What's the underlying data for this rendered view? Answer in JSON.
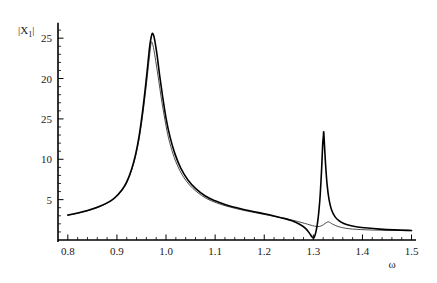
{
  "chart_data": {
    "type": "line",
    "title": "",
    "subtitle": "",
    "xlabel": "ω",
    "ylabel": "|X₁|",
    "ylabel_base": "|X",
    "ylabel_sub": "1",
    "ylabel_close": "|",
    "xlim": [
      0.78,
      1.505
    ],
    "ylim": [
      0.0,
      27.5
    ],
    "grid": false,
    "legend": null,
    "legend_position": "none",
    "x_ticks": [
      0.8,
      0.9,
      1.0,
      1.1,
      1.2,
      1.3,
      1.4,
      1.5
    ],
    "x_tick_labels": [
      "0.8",
      "0.9",
      "1.0",
      "1.1",
      "1.2",
      "1.3",
      "1.4",
      "1.5"
    ],
    "x_minor_step": 0.02,
    "y_ticks": [
      5,
      10,
      15,
      20,
      25
    ],
    "y_tick_labels": [
      "5",
      "10",
      "25",
      "20",
      "25"
    ],
    "y_tick_label_note": "third label printed as 25 in source (typo for 15)",
    "y_minor_step": 1,
    "annotations": [],
    "series": [
      {
        "name": "primary",
        "style": "solid-thick",
        "color": "#000000",
        "peaks": [
          {
            "x": 0.972,
            "y": 25.6,
            "label": "resonance-1"
          },
          {
            "x": 1.321,
            "y": 13.4,
            "label": "resonance-2"
          }
        ],
        "antiresonance": [
          {
            "x": 1.301,
            "y": 0.25
          }
        ],
        "x": [
          0.8,
          0.82,
          0.84,
          0.86,
          0.88,
          0.895,
          0.91,
          0.92,
          0.93,
          0.938,
          0.945,
          0.952,
          0.958,
          0.963,
          0.967,
          0.97,
          0.972,
          0.975,
          0.978,
          0.982,
          0.987,
          0.993,
          1.0,
          1.008,
          1.018,
          1.03,
          1.045,
          1.06,
          1.08,
          1.1,
          1.12,
          1.14,
          1.16,
          1.18,
          1.2,
          1.22,
          1.24,
          1.258,
          1.272,
          1.284,
          1.292,
          1.297,
          1.3,
          1.302,
          1.305,
          1.308,
          1.311,
          1.314,
          1.317,
          1.319,
          1.3205,
          1.321,
          1.3215,
          1.323,
          1.325,
          1.328,
          1.332,
          1.337,
          1.344,
          1.352,
          1.362,
          1.375,
          1.39,
          1.41,
          1.435,
          1.465,
          1.5
        ],
        "y": [
          3.1,
          3.35,
          3.65,
          4.05,
          4.6,
          5.2,
          6.2,
          7.2,
          8.8,
          10.6,
          12.8,
          15.8,
          18.9,
          21.8,
          24.1,
          25.2,
          25.6,
          25.3,
          24.4,
          22.8,
          20.4,
          17.8,
          15.1,
          12.8,
          10.7,
          8.9,
          7.4,
          6.4,
          5.45,
          4.85,
          4.4,
          4.05,
          3.75,
          3.5,
          3.25,
          2.98,
          2.68,
          2.35,
          1.95,
          1.45,
          0.85,
          0.4,
          0.25,
          0.35,
          0.95,
          1.9,
          3.4,
          5.6,
          9.0,
          11.8,
          12.9,
          13.4,
          13.1,
          11.4,
          9.3,
          6.9,
          5.0,
          3.75,
          2.9,
          2.4,
          2.05,
          1.8,
          1.62,
          1.48,
          1.35,
          1.25,
          1.18
        ]
      },
      {
        "name": "secondary",
        "style": "solid-thin",
        "color": "#2b2b2b",
        "peaks": [
          {
            "x": 0.97,
            "y": 24.5,
            "label": "resonance-1"
          },
          {
            "x": 1.33,
            "y": 2.25,
            "label": "resonance-2"
          }
        ],
        "antiresonance": [],
        "x": [
          0.8,
          0.82,
          0.84,
          0.86,
          0.88,
          0.895,
          0.91,
          0.92,
          0.93,
          0.938,
          0.945,
          0.952,
          0.958,
          0.963,
          0.967,
          0.97,
          0.973,
          0.976,
          0.98,
          0.985,
          0.99,
          0.996,
          1.003,
          1.012,
          1.022,
          1.034,
          1.048,
          1.063,
          1.082,
          1.102,
          1.122,
          1.142,
          1.162,
          1.182,
          1.202,
          1.222,
          1.242,
          1.26,
          1.275,
          1.288,
          1.298,
          1.306,
          1.312,
          1.318,
          1.324,
          1.328,
          1.33,
          1.333,
          1.337,
          1.342,
          1.35,
          1.36,
          1.372,
          1.388,
          1.408,
          1.432,
          1.462,
          1.5
        ],
        "y": [
          3.05,
          3.3,
          3.6,
          4.0,
          4.55,
          5.12,
          6.1,
          7.08,
          8.65,
          10.35,
          12.45,
          15.25,
          18.2,
          20.9,
          23.1,
          24.5,
          24.2,
          23.3,
          21.8,
          19.8,
          17.7,
          15.5,
          13.2,
          11.1,
          9.4,
          7.95,
          6.8,
          5.95,
          5.15,
          4.62,
          4.22,
          3.9,
          3.62,
          3.38,
          3.14,
          2.9,
          2.66,
          2.42,
          2.18,
          1.96,
          1.78,
          1.68,
          1.68,
          1.8,
          2.05,
          2.2,
          2.25,
          2.2,
          2.05,
          1.88,
          1.68,
          1.52,
          1.4,
          1.32,
          1.26,
          1.22,
          1.19,
          1.16
        ]
      }
    ]
  },
  "figure": {
    "background_color": "#ffffff",
    "axis_color": "#000000",
    "text_color": "#1a1a1a"
  }
}
